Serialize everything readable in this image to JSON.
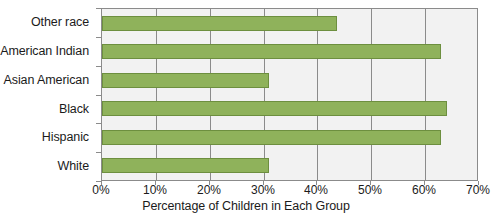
{
  "chart_data": {
    "type": "bar",
    "orientation": "horizontal",
    "title": "",
    "xlabel": "Percentage of Children in Each Group",
    "ylabel": "",
    "categories": [
      "Other race",
      "American Indian",
      "Asian American",
      "Black",
      "Hispanic",
      "White"
    ],
    "values": [
      43.7,
      63.0,
      31.0,
      64.0,
      63.0,
      31.0
    ],
    "series": [
      {
        "name": "Percentage of Children in Each Group",
        "values": [
          43.7,
          63.0,
          31.0,
          64.0,
          63.0,
          31.0
        ]
      }
    ],
    "xlim": [
      0,
      70
    ],
    "xticks": [
      0,
      10,
      20,
      30,
      40,
      50,
      60,
      70
    ],
    "xtick_labels": [
      "0%",
      "10%",
      "20%",
      "30%",
      "40%",
      "50%",
      "60%",
      "70%"
    ],
    "grid": "vertical",
    "legend": "none",
    "bar_color": "#8fb25b",
    "bar_border_color": "#6d8f3f",
    "plot_background": "#f2f2f2",
    "axis_color": "#8b8b8b"
  }
}
